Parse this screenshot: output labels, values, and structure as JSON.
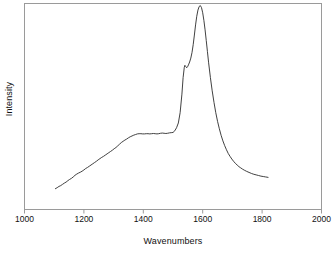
{
  "figure": {
    "background_color": "#ffffff",
    "frame_color": "#9a9a9a",
    "line_color": "#2b2b2b",
    "text_color": "#111111"
  },
  "axis": {
    "x_title": "Wavenumbers",
    "y_title": "Intensity",
    "x_tick_labels": [
      "1000",
      "1200",
      "1400",
      "1600",
      "1800",
      "2000"
    ]
  },
  "chart_data": {
    "type": "line",
    "title": "",
    "subtitle": "",
    "xlabel": "Wavenumbers",
    "ylabel": "Intensity",
    "xlim": [
      1000,
      2000
    ],
    "ylim": [
      0,
      1
    ],
    "xticks": [
      1000,
      1200,
      1400,
      1600,
      1800,
      2000
    ],
    "xtick_labels": [
      "1000",
      "1200",
      "1400",
      "1600",
      "1800",
      "2000"
    ],
    "yticks": [],
    "ytick_labels": [],
    "grid": false,
    "legend": null,
    "legend_position": "none",
    "annotations": [],
    "series": [
      {
        "name": "spectrum",
        "color": "#2b2b2b",
        "line_width": 0.9,
        "x": [
          1104,
          1110,
          1116,
          1122,
          1128,
          1134,
          1140,
          1146,
          1152,
          1158,
          1164,
          1170,
          1176,
          1182,
          1188,
          1194,
          1200,
          1206,
          1212,
          1218,
          1224,
          1230,
          1236,
          1242,
          1248,
          1254,
          1260,
          1266,
          1272,
          1278,
          1284,
          1290,
          1296,
          1302,
          1308,
          1314,
          1320,
          1326,
          1332,
          1338,
          1344,
          1350,
          1356,
          1362,
          1368,
          1374,
          1380,
          1386,
          1392,
          1398,
          1404,
          1410,
          1416,
          1422,
          1428,
          1434,
          1440,
          1446,
          1452,
          1458,
          1464,
          1470,
          1476,
          1482,
          1488,
          1494,
          1500,
          1506,
          1512,
          1518,
          1524,
          1530,
          1534,
          1538,
          1540,
          1543,
          1546,
          1549,
          1552,
          1556,
          1560,
          1564,
          1568,
          1572,
          1576,
          1580,
          1584,
          1588,
          1592,
          1596,
          1600,
          1604,
          1608,
          1612,
          1616,
          1620,
          1626,
          1632,
          1638,
          1644,
          1650,
          1656,
          1662,
          1668,
          1674,
          1680,
          1686,
          1692,
          1698,
          1704,
          1710,
          1716,
          1722,
          1728,
          1734,
          1740,
          1748,
          1756,
          1764,
          1772,
          1780,
          1788,
          1796,
          1804,
          1812,
          1820
        ],
        "y": [
          0.101,
          0.106,
          0.112,
          0.116,
          0.122,
          0.128,
          0.133,
          0.14,
          0.146,
          0.151,
          0.158,
          0.166,
          0.172,
          0.177,
          0.181,
          0.186,
          0.192,
          0.199,
          0.204,
          0.21,
          0.216,
          0.222,
          0.228,
          0.234,
          0.241,
          0.247,
          0.253,
          0.258,
          0.264,
          0.27,
          0.276,
          0.282,
          0.288,
          0.295,
          0.301,
          0.309,
          0.317,
          0.325,
          0.331,
          0.337,
          0.342,
          0.348,
          0.353,
          0.357,
          0.361,
          0.364,
          0.367,
          0.368,
          0.368,
          0.367,
          0.367,
          0.368,
          0.368,
          0.367,
          0.368,
          0.369,
          0.368,
          0.367,
          0.368,
          0.37,
          0.371,
          0.37,
          0.369,
          0.37,
          0.372,
          0.373,
          0.374,
          0.382,
          0.397,
          0.42,
          0.47,
          0.56,
          0.64,
          0.69,
          0.7,
          0.694,
          0.688,
          0.693,
          0.702,
          0.716,
          0.735,
          0.762,
          0.8,
          0.847,
          0.896,
          0.938,
          0.968,
          0.985,
          0.99,
          0.98,
          0.955,
          0.918,
          0.872,
          0.82,
          0.766,
          0.712,
          0.64,
          0.576,
          0.52,
          0.47,
          0.428,
          0.392,
          0.36,
          0.333,
          0.31,
          0.29,
          0.272,
          0.258,
          0.245,
          0.234,
          0.224,
          0.216,
          0.208,
          0.202,
          0.196,
          0.191,
          0.185,
          0.18,
          0.175,
          0.171,
          0.168,
          0.165,
          0.162,
          0.16,
          0.158,
          0.156
        ]
      }
    ]
  }
}
